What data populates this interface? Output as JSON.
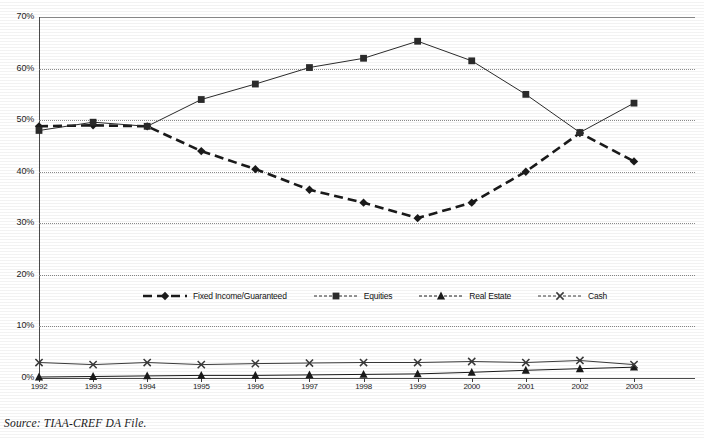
{
  "chart_data": {
    "type": "line",
    "title": "",
    "xlabel": "",
    "ylabel": "",
    "x": [
      "1992",
      "1993",
      "1994",
      "1995",
      "1996",
      "1997",
      "1998",
      "1999",
      "2000",
      "2001",
      "2002",
      "2003"
    ],
    "ylim": [
      0,
      70
    ],
    "ytick_labels": [
      "0%",
      "10%",
      "20%",
      "30%",
      "40%",
      "50%",
      "60%",
      "70%"
    ],
    "ytick_values": [
      0,
      10,
      20,
      30,
      40,
      50,
      60,
      70
    ],
    "ytick_format": "percent",
    "grid": "horizontal-dotted",
    "legend_position": "inside-center",
    "series": [
      {
        "name": "Fixed Income/Guaranteed",
        "marker": "diamond",
        "line_style": "thick-dashed",
        "color": "#1a1a1a",
        "values": [
          48.8,
          49.0,
          48.8,
          44.0,
          40.5,
          36.5,
          34.0,
          31.0,
          34.0,
          40.0,
          47.5,
          42.0
        ]
      },
      {
        "name": "Equities",
        "marker": "square",
        "line_style": "solid-thin",
        "color": "#2b2b2b",
        "values": [
          48.0,
          49.6,
          48.8,
          54.0,
          57.0,
          60.2,
          62.0,
          65.3,
          61.5,
          55.0,
          47.6,
          53.3
        ]
      },
      {
        "name": "Real Estate",
        "marker": "triangle",
        "line_style": "solid-thin",
        "color": "#1a1a1a",
        "values": [
          0.2,
          0.3,
          0.4,
          0.5,
          0.5,
          0.6,
          0.7,
          0.8,
          1.1,
          1.5,
          1.8,
          2.1
        ]
      },
      {
        "name": "Cash",
        "marker": "x",
        "line_style": "solid-thin",
        "color": "#3a3a3a",
        "values": [
          3.0,
          2.6,
          3.0,
          2.6,
          2.8,
          2.9,
          3.0,
          3.0,
          3.2,
          3.0,
          3.4,
          2.6
        ]
      }
    ]
  },
  "legend": {
    "items": [
      {
        "label": "Fixed Income/Guaranteed",
        "marker": "diamond-marker-icon"
      },
      {
        "label": "Equities",
        "marker": "square-marker-icon"
      },
      {
        "label": "Real Estate",
        "marker": "triangle-marker-icon"
      },
      {
        "label": "Cash",
        "marker": "x-marker-icon"
      }
    ]
  },
  "footnote": {
    "source": "Source: TIAA-CREF DA File."
  }
}
